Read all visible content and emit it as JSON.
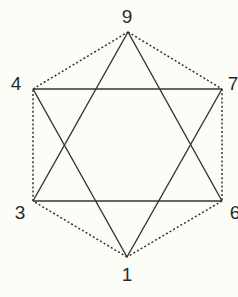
{
  "diagram": {
    "title": "",
    "colors": {
      "background": "#fdfdf8",
      "line": "#333333",
      "label": "#2a2a2a"
    },
    "nodes": [
      {
        "id": "9",
        "label": "9",
        "x": 128,
        "y": 32,
        "lx": 127,
        "ly": 23
      },
      {
        "id": "4",
        "label": "4",
        "x": 33,
        "y": 89,
        "lx": 16,
        "ly": 90
      },
      {
        "id": "7",
        "label": "7",
        "x": 222,
        "y": 89,
        "lx": 233,
        "ly": 90
      },
      {
        "id": "3",
        "label": "3",
        "x": 33,
        "y": 201,
        "lx": 20,
        "ly": 219
      },
      {
        "id": "6",
        "label": "6",
        "x": 222,
        "y": 201,
        "lx": 235,
        "ly": 219
      },
      {
        "id": "1",
        "label": "1",
        "x": 127,
        "y": 257,
        "lx": 127,
        "ly": 281
      }
    ],
    "solid_edges": [
      [
        "9",
        "3"
      ],
      [
        "3",
        "6"
      ],
      [
        "6",
        "9"
      ],
      [
        "4",
        "7"
      ],
      [
        "7",
        "1"
      ],
      [
        "1",
        "4"
      ]
    ],
    "dashed_edges": [
      [
        "9",
        "7"
      ],
      [
        "7",
        "6"
      ],
      [
        "6",
        "1"
      ],
      [
        "1",
        "3"
      ],
      [
        "3",
        "4"
      ],
      [
        "4",
        "9"
      ]
    ]
  }
}
